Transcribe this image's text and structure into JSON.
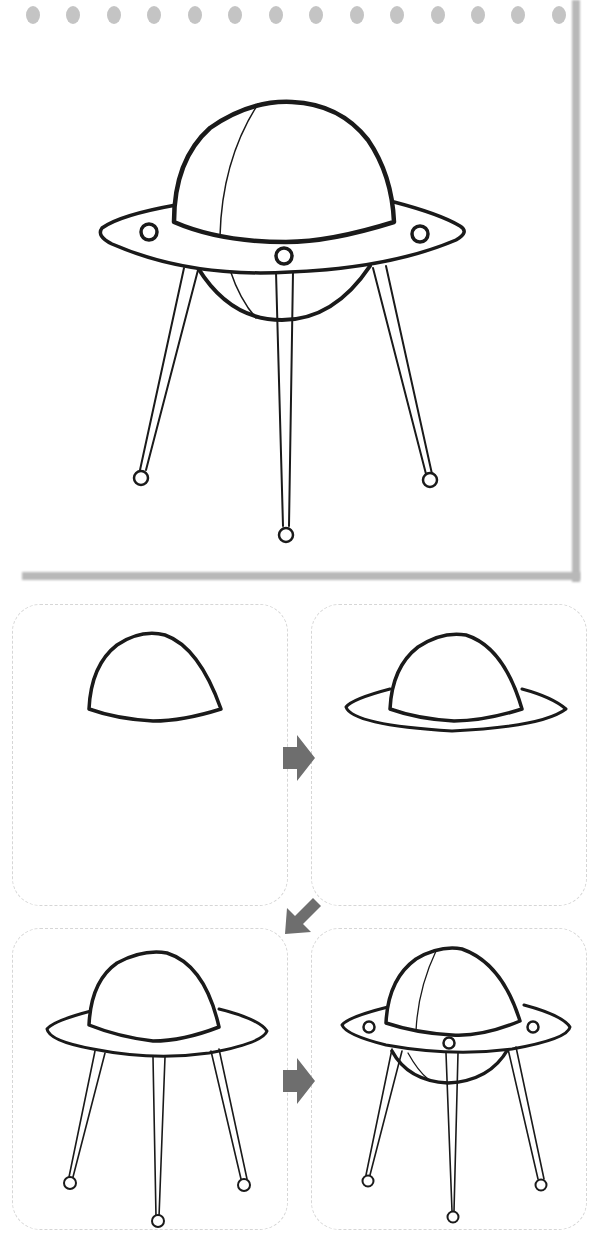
{
  "notepad": {
    "ring_holes": 14,
    "final_drawing": "ufo-complete"
  },
  "steps": [
    {
      "index": 1,
      "drawing": "dome"
    },
    {
      "index": 2,
      "drawing": "dome-with-saucer-rim"
    },
    {
      "index": 3,
      "drawing": "saucer-with-three-legs"
    },
    {
      "index": 4,
      "drawing": "complete-ufo-with-lights-and-underside"
    }
  ],
  "arrows": [
    {
      "from": 1,
      "to": 2,
      "direction": "right"
    },
    {
      "from": 2,
      "to": 3,
      "direction": "down-left"
    },
    {
      "from": 3,
      "to": 4,
      "direction": "right"
    }
  ],
  "colors": {
    "line": "#1a1a1a",
    "arrow": "#6e6e6e",
    "panel_border": "#d6d6d6",
    "shadow": "#b8b8b8"
  }
}
